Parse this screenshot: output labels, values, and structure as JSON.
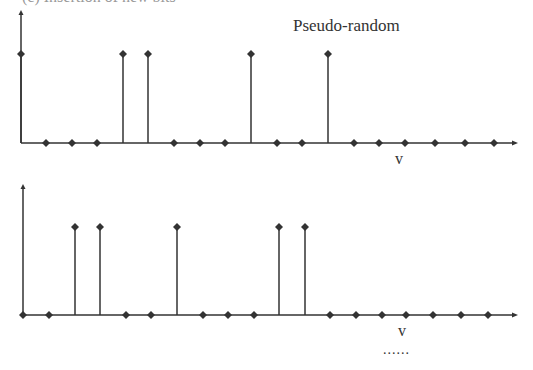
{
  "header_fragment": "(c)     Insertion of new bits",
  "chart_data": [
    {
      "type": "stem",
      "title": "Pseudo-random",
      "xlabel": "v",
      "ylabel": "",
      "x": [
        21,
        46,
        72,
        97,
        123,
        148,
        174,
        200,
        225,
        251,
        277,
        302,
        328,
        354,
        379,
        405,
        435,
        465,
        494
      ],
      "values": [
        1,
        0,
        0,
        0,
        1,
        1,
        0,
        0,
        0,
        1,
        0,
        0,
        1,
        0,
        0,
        0,
        0,
        0,
        0
      ],
      "axis_y": 143,
      "stem_top": 54,
      "axis_x_start": 21,
      "axis_x_end": 518,
      "yaxis_top": 10
    },
    {
      "type": "stem",
      "title": "",
      "xlabel": "v",
      "ylabel": "",
      "x": [
        23,
        49,
        75,
        100,
        126,
        151,
        177,
        203,
        228,
        254,
        279,
        305,
        330,
        356,
        382,
        406,
        433,
        461,
        488
      ],
      "values": [
        0,
        0,
        1,
        1,
        0,
        0,
        1,
        0,
        0,
        0,
        1,
        1,
        0,
        0,
        0,
        0,
        0,
        0,
        0
      ],
      "axis_y": 315,
      "stem_top": 227,
      "axis_x_start": 23,
      "axis_x_end": 518,
      "yaxis_top": 184
    }
  ],
  "labels": {
    "title_top": "Pseudo-random",
    "v_top": "v",
    "v_bottom": "v",
    "ellipsis": "......"
  }
}
